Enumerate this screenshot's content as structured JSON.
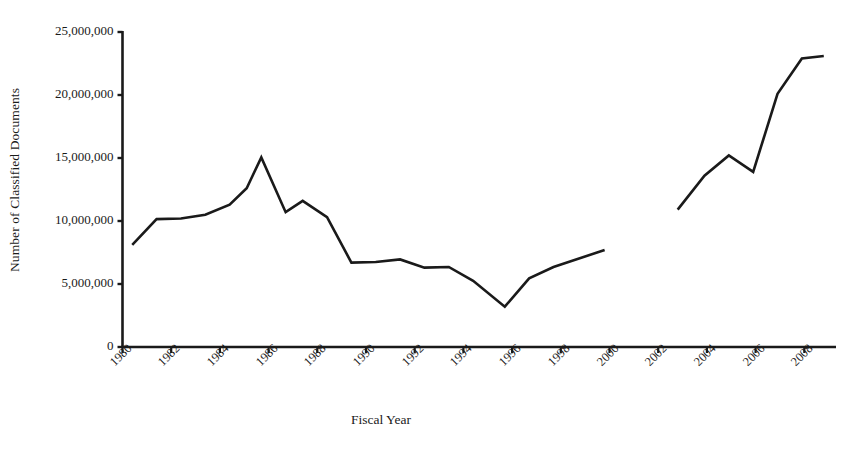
{
  "chart_data": {
    "type": "line",
    "title": "",
    "xlabel": "Fiscal Year",
    "ylabel": "Number of Classified Documents",
    "xlim": [
      1980,
      2009
    ],
    "ylim": [
      0,
      25000000
    ],
    "grid": false,
    "legend": "none",
    "y_ticks": [
      0,
      5000000,
      10000000,
      15000000,
      20000000,
      25000000
    ],
    "y_tick_labels": [
      "0",
      "5,000,000",
      "10,000,000",
      "15,000,000",
      "20,000,000",
      "25,000,000"
    ],
    "x_ticks": [
      1980,
      1982,
      1984,
      1986,
      1988,
      1990,
      1992,
      1994,
      1996,
      1998,
      2000,
      2002,
      2004,
      2006,
      2008
    ],
    "x_tick_labels": [
      "1980",
      "1982",
      "1984",
      "1986",
      "1988",
      "1990",
      "1992",
      "1994",
      "1996",
      "1998",
      "2000",
      "2002",
      "2004",
      "2006",
      "2008"
    ],
    "line_color": "#1a1a1a",
    "line_width": 2.6,
    "series": [
      {
        "name": "Classified documents (FY1980-FY1999)",
        "x": [
          1980.4,
          1981.4,
          1982.4,
          1983.4,
          1984.4,
          1985.1,
          1985.7,
          1986.7,
          1987.4,
          1988.4,
          1989.4,
          1990.4,
          1991.4,
          1992.4,
          1993.4,
          1994.4,
          1995.7,
          1996.7,
          1997.7,
          1999.8
        ],
        "values": [
          8100000,
          10150000,
          10200000,
          10500000,
          11300000,
          12600000,
          15050000,
          10700000,
          11600000,
          10300000,
          6700000,
          6750000,
          6950000,
          6300000,
          6350000,
          5250000,
          3200000,
          5450000,
          6350000,
          7700000
        ]
      },
      {
        "name": "Classified documents (FY2002-FY2008)",
        "x": [
          2002.8,
          2003.9,
          2004.9,
          2005.9,
          2006.9,
          2007.9,
          2008.8
        ],
        "values": [
          10900000,
          13600000,
          15200000,
          13900000,
          20100000,
          22900000,
          23100000
        ]
      }
    ]
  },
  "axes": {
    "y_axis_name": "y-axis",
    "x_axis_name": "x-axis"
  }
}
